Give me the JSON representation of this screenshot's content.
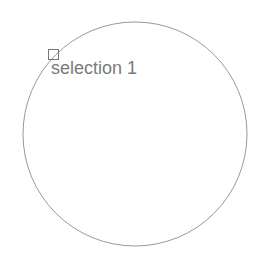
{
  "canvas": {
    "width": 255,
    "height": 258,
    "background": "#ffffff"
  },
  "circle": {
    "cx": 135,
    "cy": 134,
    "r": 112,
    "stroke": "#9a9a9a"
  },
  "selection": {
    "label": "selection 1",
    "label_color": "#7a7a7a",
    "handle": {
      "x": 48,
      "y": 49,
      "size": 10,
      "stroke": "#777777"
    }
  }
}
